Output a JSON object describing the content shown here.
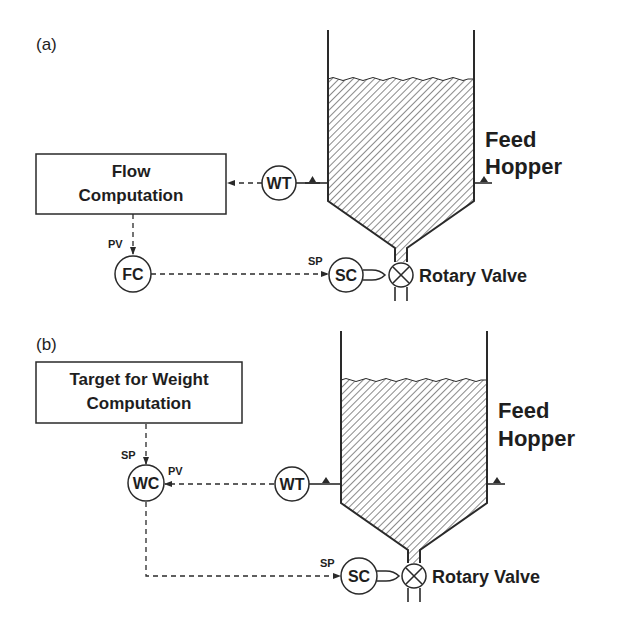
{
  "panel_a": {
    "label": "(a)",
    "box_line1": "Flow",
    "box_line2": "Computation",
    "weight_transmitter": "WT",
    "flow_controller": "FC",
    "speed_controller": "SC",
    "pv_label": "PV",
    "sp_label": "SP",
    "hopper_line1": "Feed",
    "hopper_line2": "Hopper",
    "valve_label": "Rotary Valve"
  },
  "panel_b": {
    "label": "(b)",
    "box_line1": "Target for Weight",
    "box_line2": "Computation",
    "weight_transmitter": "WT",
    "weight_controller": "WC",
    "speed_controller": "SC",
    "pv_label": "PV",
    "sp_label_wc": "SP",
    "sp_label_sc": "SP",
    "hopper_line1": "Feed",
    "hopper_line2": "Hopper",
    "valve_label": "Rotary Valve"
  },
  "colors": {
    "ink": "#1e1e1e",
    "background": "#ffffff"
  }
}
